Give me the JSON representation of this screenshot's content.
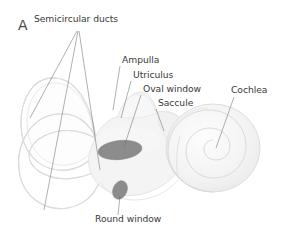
{
  "figure": {
    "panel_letter": "A",
    "background_color": "#ffffff"
  },
  "colors": {
    "label_text": "#3a3a3a",
    "leader_line": "#6e6e6e",
    "structure_outline": "#dcdcdc",
    "structure_fill": "#f4f4f4",
    "window_fill": "#8c8c8c",
    "cochlea_line": "#d6d6d6"
  },
  "labels": [
    {
      "id": "semicircular-ducts",
      "text": "Semicircular ducts",
      "x": 76,
      "y": 22,
      "anchor": "middle"
    },
    {
      "id": "ampulla",
      "text": "Ampulla",
      "x": 122,
      "y": 63,
      "anchor": "start"
    },
    {
      "id": "utriculus",
      "text": "Utriculus",
      "x": 133,
      "y": 78,
      "anchor": "start"
    },
    {
      "id": "oval-window",
      "text": "Oval window",
      "x": 143,
      "y": 92,
      "anchor": "start"
    },
    {
      "id": "saccule",
      "text": "Saccule",
      "x": 158,
      "y": 106,
      "anchor": "start"
    },
    {
      "id": "cochlea",
      "text": "Cochlea",
      "x": 231,
      "y": 93,
      "anchor": "start"
    },
    {
      "id": "round-window",
      "text": "Round window",
      "x": 95,
      "y": 222,
      "anchor": "start"
    }
  ],
  "structures": [
    {
      "id": "anterior-semicircular-duct",
      "name": "anterior semicircular duct"
    },
    {
      "id": "posterior-semicircular-duct",
      "name": "posterior semicircular duct"
    },
    {
      "id": "lateral-semicircular-duct",
      "name": "lateral semicircular duct"
    },
    {
      "id": "ampulla",
      "name": "ampulla"
    },
    {
      "id": "utriculus",
      "name": "utriculus"
    },
    {
      "id": "saccule",
      "name": "saccule"
    },
    {
      "id": "oval-window",
      "name": "oval window"
    },
    {
      "id": "round-window",
      "name": "round window"
    },
    {
      "id": "cochlea",
      "name": "cochlea"
    }
  ]
}
